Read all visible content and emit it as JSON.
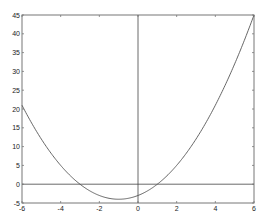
{
  "chart_data": {
    "type": "line",
    "title": "",
    "xlabel": "",
    "ylabel": "",
    "xlim": [
      -6,
      6
    ],
    "ylim": [
      -5,
      45
    ],
    "grid": false,
    "legend": null,
    "xticks": [
      -6,
      -4,
      -2,
      0,
      2,
      4,
      6
    ],
    "yticks": [
      -5,
      0,
      5,
      10,
      15,
      20,
      25,
      30,
      35,
      40,
      45
    ],
    "series": [
      {
        "name": "y = x^2 + 2x - 3",
        "x": [
          -6,
          -5,
          -4,
          -3,
          -2,
          -1,
          0,
          1,
          2,
          3,
          4,
          5,
          6
        ],
        "values": [
          21,
          12,
          5,
          0,
          -3,
          -4,
          -3,
          0,
          5,
          12,
          21,
          32,
          45
        ]
      }
    ],
    "reference_lines": [
      {
        "type": "horizontal",
        "y": 0
      },
      {
        "type": "vertical",
        "x": 0
      }
    ]
  },
  "colors": {
    "curve": "#555555",
    "axes": "#777777",
    "reference": "#444444"
  }
}
